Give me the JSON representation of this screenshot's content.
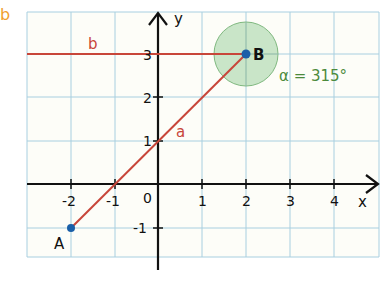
{
  "task_label": "b",
  "colors": {
    "grid": "#a8cfe0",
    "background": "#fdfdf8",
    "axis": "#111111",
    "line": "#c8463a",
    "point": "#1a5fa8",
    "angle_fill": "#bfe0bf",
    "angle_stroke": "#7fb87f",
    "angle_text": "#4c8a3c",
    "task_label": "#f0a030"
  },
  "axes": {
    "x_label": "x",
    "y_label": "y",
    "x_ticks": [
      "-2",
      "-1",
      "1",
      "2",
      "3",
      "4"
    ],
    "y_ticks": [
      "3",
      "2",
      "1",
      "-1"
    ],
    "origin_label": "0"
  },
  "lines": {
    "a": {
      "label": "a"
    },
    "b": {
      "label": "b"
    }
  },
  "points": {
    "A": {
      "label": "A",
      "x": -2,
      "y": -1
    },
    "B": {
      "label": "B",
      "x": 2,
      "y": 3
    }
  },
  "angle": {
    "text": "α = 315°"
  }
}
